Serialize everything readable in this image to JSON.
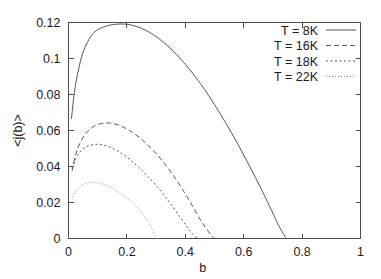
{
  "chart_data": {
    "type": "line",
    "title": "",
    "xlabel": "b",
    "ylabel": "<j(b)>",
    "xlim": [
      0,
      1
    ],
    "ylim": [
      0,
      0.12
    ],
    "grid": false,
    "legend_position": "top-right",
    "xticks": [
      "0",
      "0.2",
      "0.4",
      "0.6",
      "0.8",
      "1"
    ],
    "xtick_values": [
      0,
      0.2,
      0.4,
      0.6,
      0.8,
      1
    ],
    "yticks": [
      "0",
      "0.02",
      "0.04",
      "0.06",
      "0.08",
      "0.1",
      "0.12"
    ],
    "ytick_values": [
      0,
      0.02,
      0.04,
      0.06,
      0.08,
      0.1,
      0.12
    ],
    "series": [
      {
        "name": "T = 8K",
        "style": "solid",
        "dash": "none",
        "color": "#555555",
        "x": [
          0.01,
          0.02,
          0.03,
          0.045,
          0.06,
          0.08,
          0.1,
          0.12,
          0.14,
          0.16,
          0.18,
          0.2,
          0.22,
          0.25,
          0.28,
          0.31,
          0.34,
          0.37,
          0.4,
          0.43,
          0.46,
          0.5,
          0.54,
          0.58,
          0.62,
          0.66,
          0.7,
          0.72,
          0.745
        ],
        "y": [
          0.0665,
          0.081,
          0.0905,
          0.101,
          0.1075,
          0.113,
          0.116,
          0.1175,
          0.1185,
          0.119,
          0.1192,
          0.119,
          0.1184,
          0.1168,
          0.1143,
          0.111,
          0.107,
          0.1022,
          0.0968,
          0.0908,
          0.0842,
          0.0744,
          0.0638,
          0.0524,
          0.0402,
          0.0276,
          0.014,
          0.0072,
          0.0
        ]
      },
      {
        "name": "T = 16K",
        "style": "dashed",
        "dash": "5,3",
        "color": "#555555",
        "x": [
          0.012,
          0.025,
          0.04,
          0.055,
          0.07,
          0.09,
          0.11,
          0.13,
          0.145,
          0.16,
          0.18,
          0.2,
          0.22,
          0.245,
          0.27,
          0.3,
          0.33,
          0.36,
          0.39,
          0.42,
          0.45,
          0.47,
          0.49,
          0.5
        ],
        "y": [
          0.0375,
          0.0468,
          0.0532,
          0.0574,
          0.0602,
          0.0626,
          0.0638,
          0.0642,
          0.0641,
          0.0636,
          0.0625,
          0.0608,
          0.0588,
          0.0558,
          0.0522,
          0.0472,
          0.0414,
          0.0348,
          0.0274,
          0.0194,
          0.0108,
          0.006,
          0.0014,
          0.0
        ]
      },
      {
        "name": "T = 18K",
        "style": "dotted",
        "dash": "2,2.5",
        "color": "#555555",
        "x": [
          0.012,
          0.025,
          0.04,
          0.055,
          0.07,
          0.085,
          0.1,
          0.115,
          0.13,
          0.15,
          0.17,
          0.19,
          0.215,
          0.24,
          0.265,
          0.295,
          0.325,
          0.355,
          0.385,
          0.41,
          0.43,
          0.445
        ],
        "y": [
          0.039,
          0.0444,
          0.0482,
          0.0504,
          0.0516,
          0.0522,
          0.0523,
          0.052,
          0.0514,
          0.0501,
          0.0484,
          0.0463,
          0.0432,
          0.0396,
          0.0356,
          0.0304,
          0.0246,
          0.0182,
          0.0112,
          0.0056,
          0.0016,
          0.0
        ]
      },
      {
        "name": "T = 22K",
        "style": "fine-dotted",
        "dash": "1,2",
        "color": "#8a8a8a",
        "x": [
          0.012,
          0.022,
          0.035,
          0.05,
          0.065,
          0.08,
          0.095,
          0.11,
          0.125,
          0.14,
          0.16,
          0.18,
          0.2,
          0.22,
          0.24,
          0.26,
          0.275,
          0.29,
          0.3
        ],
        "y": [
          0.0216,
          0.0252,
          0.0283,
          0.03,
          0.0309,
          0.0312,
          0.0311,
          0.0306,
          0.0298,
          0.0288,
          0.0271,
          0.025,
          0.0226,
          0.0198,
          0.0164,
          0.0122,
          0.0086,
          0.004,
          0.0
        ]
      }
    ]
  }
}
